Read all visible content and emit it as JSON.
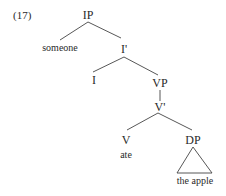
{
  "example_number": "(17)",
  "tree": {
    "nodes": {
      "IP": "IP",
      "someone": "someone",
      "I_bar": "I'",
      "I": "I",
      "VP": "VP",
      "V_bar": "V'",
      "V": "V",
      "ate": "ate",
      "DP": "DP",
      "the_apple": "the apple"
    },
    "edges": [
      [
        "IP",
        "someone"
      ],
      [
        "IP",
        "I_bar"
      ],
      [
        "I_bar",
        "I"
      ],
      [
        "I_bar",
        "VP"
      ],
      [
        "VP",
        "V_bar"
      ],
      [
        "V_bar",
        "V"
      ],
      [
        "V_bar",
        "DP"
      ],
      [
        "DP",
        "the_apple (triangle)"
      ]
    ]
  }
}
